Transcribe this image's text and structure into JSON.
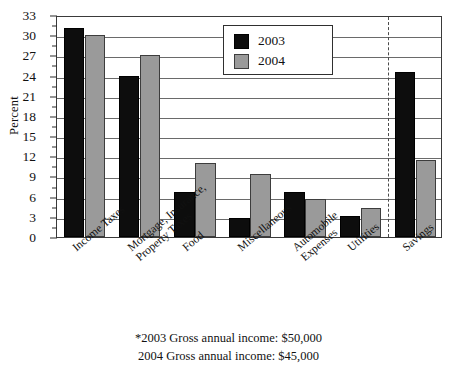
{
  "chart_data": {
    "type": "bar",
    "title": "",
    "xlabel": "",
    "ylabel": "Percent",
    "ylim": [
      0,
      33
    ],
    "ytick_step": 3,
    "yticks": [
      0,
      3,
      6,
      9,
      12,
      15,
      18,
      21,
      24,
      27,
      30,
      33
    ],
    "ytick_labels": [
      "0",
      "3",
      "6",
      "9",
      "12",
      "15",
      "18",
      "21",
      "24",
      "27",
      "30",
      "33"
    ],
    "minor_tick_step": 1.5,
    "grid": true,
    "legend_position": "top-center",
    "categories": [
      "Income Taxes",
      "Mortgage, Insurance, Property Taxes",
      "Food",
      "Miscellaneous",
      "Automobile Expenses",
      "Utilities",
      "Savings"
    ],
    "series": [
      {
        "name": "2003",
        "color": "#0d0d0d",
        "values": [
          31,
          24,
          6.7,
          2.8,
          6.7,
          3.1,
          24.5
        ]
      },
      {
        "name": "2004",
        "color": "#9a9a9a",
        "values": [
          30,
          27,
          11,
          9.4,
          5.7,
          4.3,
          11.5
        ]
      }
    ],
    "annotations": [
      "*2003 Gross annual income:  $50,000",
      "2004 Gross annual income:  $45,000"
    ],
    "separator_after_category_index": 5
  },
  "axis": {
    "y_title": "Percent"
  },
  "legend": {
    "items": [
      {
        "label": "2003",
        "color": "#0d0d0d"
      },
      {
        "label": "2004",
        "color": "#9a9a9a"
      }
    ]
  },
  "category_labels": [
    {
      "line1": "Income Taxes",
      "line2": ""
    },
    {
      "line1": "Mortgage, Insurance,",
      "line2": "Property Taxes"
    },
    {
      "line1": "Food",
      "line2": ""
    },
    {
      "line1": "Miscellaneous",
      "line2": ""
    },
    {
      "line1": "Automobile",
      "line2": "Expenses"
    },
    {
      "line1": "Utilities",
      "line2": ""
    },
    {
      "line1": "Savings",
      "line2": ""
    }
  ],
  "footnotes": {
    "line1": "*2003 Gross annual income:  $50,000",
    "line2": "2004 Gross annual income:  $45,000"
  }
}
